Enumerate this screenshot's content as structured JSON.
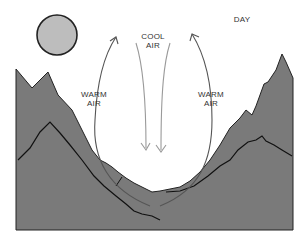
{
  "title": "DAY",
  "labels": {
    "cool_air": [
      "COOL",
      "AIR"
    ],
    "warm_air_left": [
      "WARM",
      "AIR"
    ],
    "warm_air_right": [
      "WARM",
      "AIR"
    ]
  },
  "icons": {
    "sun": "sun-icon"
  },
  "colors": {
    "mountain_fill": "#7a7a7a",
    "ridge_line": "#111111",
    "sun_fill": "#bdbdbd",
    "sun_outline": "#222222",
    "warm_arrow": "#555555",
    "cool_arrow": "#9a9a9a",
    "background": "#ffffff"
  }
}
